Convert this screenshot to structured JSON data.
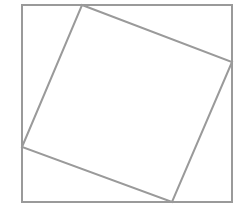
{
  "diagram": {
    "title": "",
    "stroke_color": "#9a9a9a",
    "background_color": "#ffffff",
    "stroke_width": 2,
    "outer_square": {
      "points": [
        [
          22,
          5
        ],
        [
          232,
          5
        ],
        [
          232,
          202
        ],
        [
          22,
          202
        ]
      ]
    },
    "inner_square": {
      "points": [
        [
          82,
          5
        ],
        [
          232,
          62
        ],
        [
          172,
          202
        ],
        [
          22,
          147
        ]
      ]
    }
  }
}
